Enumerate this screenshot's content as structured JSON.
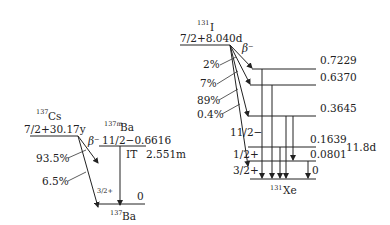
{
  "cs_scheme": {
    "parent": {
      "mass": "137",
      "symbol": "Cs",
      "level": "7/2+30.17y"
    },
    "decay_mode": "β⁻",
    "branches": [
      "93.5%",
      "6.5%"
    ],
    "isomer": {
      "mass": "137m",
      "symbol": "Ba",
      "level": "11/2−0.6616"
    },
    "it": {
      "label": "IT",
      "halflife": "2.551m"
    },
    "ground": {
      "spin": "3/2+",
      "energy": "0",
      "mass": "137",
      "symbol": "Ba"
    }
  },
  "i_scheme": {
    "parent": {
      "mass": "131",
      "symbol": "I",
      "level": "7/2+8.040d"
    },
    "decay_mode": "β⁻",
    "branches": [
      "2%",
      "7%",
      "89%",
      "0.4%"
    ],
    "levels": [
      {
        "energy": "0.7229"
      },
      {
        "energy": "0.6370"
      },
      {
        "energy": "0.3645"
      },
      {
        "energy": "0.1639",
        "spin": "11/2−"
      },
      {
        "energy": "0.0801",
        "spin": "1/2+"
      },
      {
        "energy": "0",
        "spin": "3/2+"
      }
    ],
    "isomer_halflife": "11.8d",
    "daughter": {
      "mass": "131",
      "symbol": "Xe"
    }
  }
}
